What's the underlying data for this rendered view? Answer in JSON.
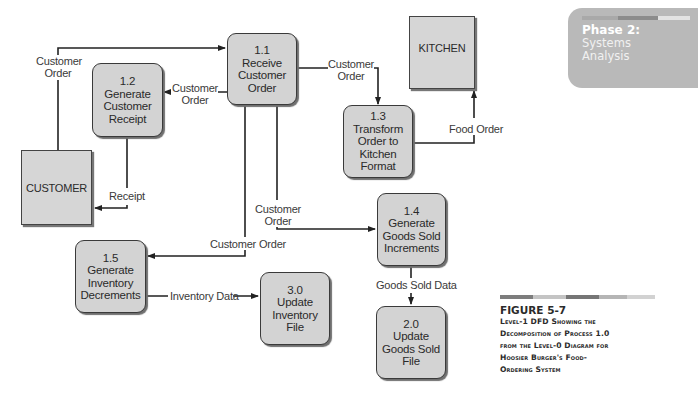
{
  "side_panel": {
    "phase_label": "Phase 2:",
    "phase_line1": "Systems",
    "phase_line2": "Analysis",
    "bar_colors": [
      "#a9a9a9",
      "#8c8c8c",
      "#e3e3e3"
    ]
  },
  "caption": {
    "figure": "FIGURE 5-7",
    "lines": [
      "Level-1 DFD Showing the",
      "Decomposition of Process 1.0",
      "from the Level-0 Diagram for",
      "Hoosier Burger's Food-",
      "Ordering System"
    ],
    "bar_colors": [
      "#7d7d7d",
      "#c4c4c4",
      "#767676",
      "#b5b5b5",
      "#d2d2d2"
    ]
  },
  "diagram": {
    "entities": {
      "customer": {
        "label": "CUSTOMER"
      },
      "kitchen": {
        "label": "KITCHEN"
      }
    },
    "processes": {
      "p1_1": {
        "id": "1.1",
        "lines": [
          "Receive",
          "Customer",
          "Order"
        ]
      },
      "p1_2": {
        "id": "1.2",
        "lines": [
          "Generate",
          "Customer",
          "Receipt"
        ]
      },
      "p1_3": {
        "id": "1.3",
        "lines": [
          "Transform",
          "Order to",
          "Kitchen",
          "Format"
        ]
      },
      "p1_4": {
        "id": "1.4",
        "lines": [
          "Generate",
          "Goods Sold",
          "Increments"
        ]
      },
      "p1_5": {
        "id": "1.5",
        "lines": [
          "Generate",
          "Inventory",
          "Decrements"
        ]
      },
      "p3_0": {
        "id": "3.0",
        "lines": [
          "Update",
          "Inventory",
          "File"
        ]
      },
      "p2_0": {
        "id": "2.0",
        "lines": [
          "Update",
          "Goods Sold",
          "File"
        ]
      }
    },
    "flows": {
      "cust_to_1_1": {
        "line1": "Customer",
        "line2": "Order"
      },
      "f1_1_to_1_2": {
        "line1": "Customer",
        "line2": "Order"
      },
      "f1_1_to_1_3": {
        "line1": "Customer",
        "line2": "Order"
      },
      "f1_3_to_kitchen": {
        "label": "Food Order"
      },
      "f1_2_to_cust": {
        "label": "Receipt"
      },
      "f1_1_to_1_4": {
        "line1": "Customer",
        "line2": "Order"
      },
      "f1_1_to_1_5": {
        "label": "Customer Order"
      },
      "f1_5_to_3_0": {
        "label": "Inventory Data"
      },
      "f1_4_to_2_0": {
        "label": "Goods Sold Data"
      }
    }
  }
}
